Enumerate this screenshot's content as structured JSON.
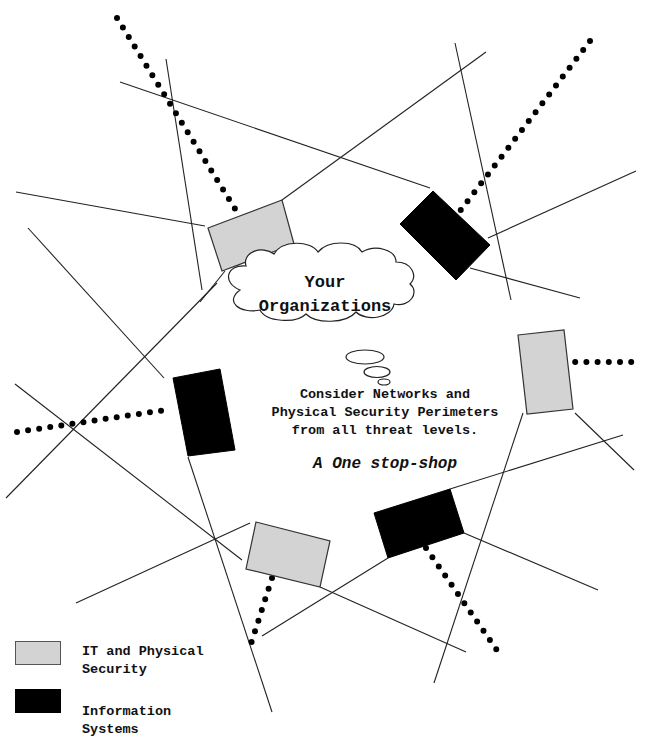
{
  "diagram": {
    "cloud_title_line1": "Your",
    "cloud_title_line2": "Organizations",
    "description_line1": "Consider Networks and",
    "description_line2": "Physical Security Perimeters",
    "description_line3": "from all threat levels.",
    "tagline": "A One stop-shop"
  },
  "legend": {
    "items": [
      {
        "label_line1": "IT and Physical",
        "label_line2": "Security",
        "color": "#d3d3d3",
        "type": "IT and Physical Security"
      },
      {
        "label_line1": "Information",
        "label_line2": "Systems",
        "color": "#000000",
        "type": "Information Systems"
      }
    ]
  },
  "colors": {
    "it_physical_security": "#d3d3d3",
    "information_systems": "#000000",
    "line": "#222222",
    "background": "#ffffff"
  }
}
